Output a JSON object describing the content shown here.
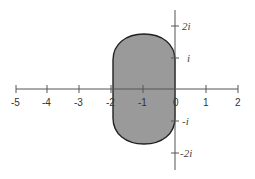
{
  "diagram": {
    "type": "complex-plane-region",
    "region": {
      "description": "Stadium-shaped shaded region centered at -1 on the real axis, spanning real part -2 to 0 and imaginary part about -1.75i to 1.75i",
      "fill": "#9a9a9a",
      "stroke": "#222222"
    },
    "real_axis": {
      "ticks": [
        -5,
        -4,
        -3,
        -2,
        -1,
        0,
        1,
        2
      ],
      "labels": [
        "-5",
        "-4",
        "-3",
        "-2",
        "-1",
        "0",
        "1",
        "2"
      ]
    },
    "imaginary_axis": {
      "ticks": [
        2,
        1,
        -1,
        -2
      ],
      "labels": [
        "2i",
        "i",
        "-i",
        "-2i"
      ]
    },
    "axis_color": "#555555"
  }
}
